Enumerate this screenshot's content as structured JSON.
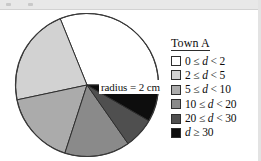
{
  "figure": {
    "annotation_label": "radius = 2 cm",
    "legend_title": "Town A"
  },
  "chart_data": {
    "type": "pie",
    "title": "Town A",
    "subtitle": "",
    "xlabel": "",
    "ylabel": "",
    "annotation": "radius = 2 cm",
    "radius_cm": 2,
    "legend_position": "right",
    "grid": false,
    "start_angle_deg": 0,
    "direction": "counterclockwise",
    "categories": [
      "0 ≤ d < 2",
      "2 ≤ d < 5",
      "5 ≤ d < 10",
      "10 ≤ d < 20",
      "20 ≤ d < 30",
      "d ≥ 30"
    ],
    "values": [
      31,
      22,
      17,
      15,
      7,
      8
    ],
    "angles_deg": [
      112,
      80,
      60,
      53,
      25,
      30
    ],
    "colors": [
      "#ffffff",
      "#d2d2d2",
      "#ababab",
      "#8a8a8a",
      "#4f4f4f",
      "#0d0d0d"
    ],
    "slices": [
      {
        "label": "0 ≤ d < 2",
        "percent": 31,
        "angle_deg": 112,
        "color": "#ffffff",
        "start_deg": 0,
        "end_deg": 112
      },
      {
        "label": "2 ≤ d < 5",
        "percent": 22,
        "angle_deg": 80,
        "color": "#d2d2d2",
        "start_deg": 112,
        "end_deg": 192
      },
      {
        "label": "5 ≤ d < 10",
        "percent": 17,
        "angle_deg": 60,
        "color": "#ababab",
        "start_deg": 192,
        "end_deg": 252
      },
      {
        "label": "10 ≤ d < 20",
        "percent": 15,
        "angle_deg": 53,
        "color": "#8a8a8a",
        "start_deg": 252,
        "end_deg": 305
      },
      {
        "label": "20 ≤ d < 30",
        "percent": 7,
        "angle_deg": 25,
        "color": "#4f4f4f",
        "start_deg": 305,
        "end_deg": 330
      },
      {
        "label": "d ≥ 30",
        "percent": 8,
        "angle_deg": 30,
        "color": "#0d0d0d",
        "start_deg": 330,
        "end_deg": 360
      }
    ]
  },
  "legend": {
    "title": "Town A",
    "items": [
      {
        "label": "0 ≤ d < 2",
        "color": "#ffffff"
      },
      {
        "label": "2 ≤ d < 5",
        "color": "#d2d2d2"
      },
      {
        "label": "5 ≤ d < 10",
        "color": "#ababab"
      },
      {
        "label": "10 ≤ d < 20",
        "color": "#8a8a8a"
      },
      {
        "label": "20 ≤ d < 30",
        "color": "#4f4f4f"
      },
      {
        "label": "d ≥ 30",
        "color": "#0d0d0d"
      }
    ]
  }
}
